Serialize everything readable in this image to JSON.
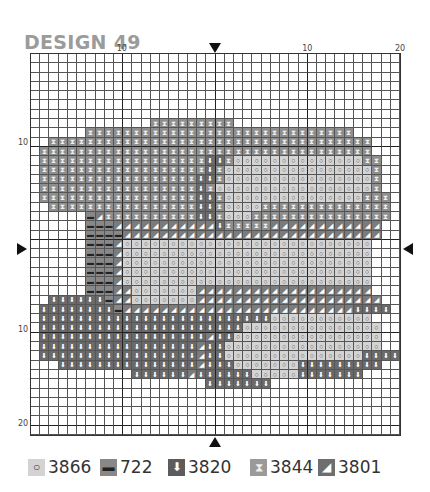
{
  "title": "DESIGN 49",
  "axis": {
    "top_ticks": [
      {
        "label": "10",
        "col": 10
      },
      {
        "label": "10",
        "col": 30
      },
      {
        "label": "20",
        "col": 40
      }
    ],
    "left_ticks": [
      {
        "label": "10",
        "row": 10
      },
      {
        "label": "10",
        "row": 30
      },
      {
        "label": "20",
        "row": 40
      }
    ]
  },
  "grid": {
    "cols": 40,
    "rows": 41,
    "center_col": 20,
    "center_row": 20,
    "pattern": [
      "........................................",
      "........................................",
      "........................................",
      "........................................",
      "........................................",
      "........................................",
      "........................................",
      ".............XXXXXXXXX..................",
      "......XXXXXXXXXXXXXXXXXXXXXXXXXXXXX.....",
      "..XXXXXXXXXXXXXXXXXXXXXXXXXXXXXXXXXXX...",
      ".XXXXXXXXXXXXXXXXXXXXXXXXXXXXXXXXXXXX...",
      ".XXXXXXXXXXXXXXXXXXDDXOOOOOOOOOOOOOOXX..",
      ".XXXXXXXXXXXXXXXXXXDXOOOOOOOOOOOOOOOOX..",
      ".XXXXXXXXXXXXXXXXXDDXOOOOOOOOOOOOOOOOX..",
      ".XXXXXXXXXXXXXXXXXDXOOOOOOOOOOOOOOOOOX..",
      ".XXXXXXXXXXXXXXXXXDDXOOOOOOOOOOOOOOOXXX.",
      "..XXXXXXXXXXXXXXXXDDXOOOOXXXXXXXXXXXXXX.",
      "......MSXXXXXXXXXXDDXOOOXXXXXXXXXXXXXXX.",
      "......MMMSSSSSSSSSSSDXXXXXSSSSSSSSSSSS..",
      "......MMMMSSSSSSSSSSSSSSSSSSSSSSSSSSSS..",
      "......MMMSOOOOOOOOOOOOOOOOOOOOOOOOOOO...",
      "......MMMSOOOOOOOOOOOOOOOOOOOOOOOOOOO...",
      "......MMMSOOOOOOOOOOOOOOOOOOOOOOOOOOO...",
      "......MMMSOOOOOOOOOOOOOOOOOOOOOOOOOOO...",
      "......MMMSOOOOOOOOOOOOOOOOOOOOOOOOOOO...",
      "......MMMSSOOOOOOOSSSSSSSSSSSSSSSSSSS...",
      "..DDDDDDMSSOOOOOOOSSSSSSSSSSSSSSSSSSSS..",
      ".DDDDDDDDMSSSSSSSSSSSSSSSSSSSSSSSSSDDDD.",
      ".DDDDDDDDDDDDDDDDDDDDDDDDDOOOOOOOOOOO...",
      ".DDDDDDDDDDDDDDDDDDDDDDOOOOOOOOOOOOOOO..",
      ".DDDDDDDDDDDDDDDDDDSDDOOOOOOOOOOOOOOOO..",
      ".DDDDDDDDDDDDDDDDDSDDOOOOOOOOOOOOOOOOO..",
      ".DDDDDDDDDDDDDDDDDSDDOOOOOOOOOOOOOOODDDD",
      "...DDDDDDDDDDDDDDDSDDDOOOOOOODDDDDDDDD..",
      "...........DDDDDDSDDDDDDOOOOODDDDDDD....",
      "...................DDDDDDD..............",
      "........................................",
      "........................................",
      "........................................",
      "........................................",
      "........................................"
    ]
  },
  "symbols": {
    "X": {
      "code": "3844",
      "glyph": "⧗",
      "icon": "hourglass-icon",
      "color": "#8e8e8e"
    },
    "O": {
      "code": "3866",
      "glyph": "○",
      "icon": "circle-icon",
      "color": "#d3d3d3"
    },
    "M": {
      "code": "722",
      "glyph": "▬",
      "icon": "dash-icon",
      "color": "#888888"
    },
    "D": {
      "code": "3820",
      "glyph": "⬇",
      "icon": "down-arrow-icon",
      "color": "#6a6a6a"
    },
    "S": {
      "code": "3801",
      "glyph": "◢",
      "icon": "half-triangle-icon",
      "color": "#7b7b7b"
    }
  },
  "legend": [
    {
      "key": "O",
      "code": "3866",
      "glyph": "○",
      "swatch": "#d3d3d3",
      "glyph_color": "#333"
    },
    {
      "key": "M",
      "code": "722",
      "glyph": "▬",
      "swatch": "#888888",
      "glyph_color": "#222"
    },
    {
      "key": "D",
      "code": "3820",
      "glyph": "⬇",
      "swatch": "#5c5c5c",
      "glyph_color": "#fff"
    },
    {
      "key": "X",
      "code": "3844",
      "glyph": "⧗",
      "swatch": "#9a9a9a",
      "glyph_color": "#eee"
    },
    {
      "key": "S",
      "code": "3801",
      "glyph": "◢",
      "swatch": "#6e6e6e",
      "glyph_color": "#fff"
    }
  ]
}
